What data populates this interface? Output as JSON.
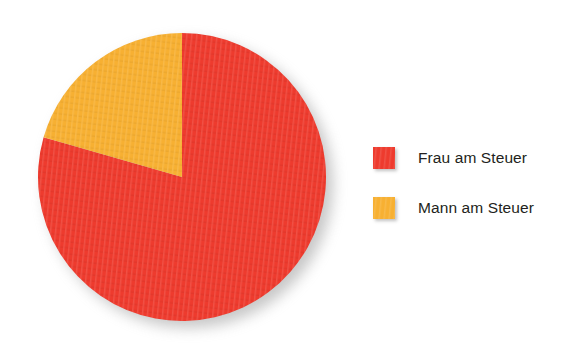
{
  "chart_data": {
    "type": "pie",
    "title": "",
    "subtitle": "",
    "xlabel": "",
    "ylabel": "",
    "grid": false,
    "legend_position": "right",
    "start_angle_deg": 0,
    "direction": "mixed",
    "labels": [
      "Frau am Steuer",
      "Mann am Steuer"
    ],
    "values": [
      80,
      20
    ],
    "value_unit": "%",
    "colors": [
      "#ee3b2e",
      "#f7b032"
    ],
    "slices": [
      {
        "label": "Frau am Steuer",
        "value": 80,
        "percent": "80%",
        "color": "#ee3b2e",
        "start_deg": 0,
        "sweep_deg": 286,
        "sweep_direction": "clockwise"
      },
      {
        "label": "Mann am Steuer",
        "value": 20,
        "percent": "20%",
        "color": "#f7b032",
        "start_deg": 0,
        "sweep_deg": 74,
        "sweep_direction": "counter-clockwise"
      }
    ]
  },
  "legend": {
    "items": [
      {
        "label": "Frau am Steuer",
        "color": "#ee3b2e",
        "swatch_name": "legend-swatch-frau"
      },
      {
        "label": "Mann am Steuer",
        "color": "#f7b032",
        "swatch_name": "legend-swatch-mann"
      }
    ]
  },
  "geometry": {
    "center_x": 144,
    "center_y": 144,
    "radius": 144
  },
  "palette": {
    "background": "#ffffff",
    "text": "#231f20",
    "shadow": "#9a9a9a"
  }
}
